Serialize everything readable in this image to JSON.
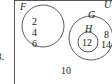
{
  "problem_number": "8.",
  "diagram": {
    "universal_label": "U",
    "sets": [
      {
        "label": "F",
        "elements": [
          "2",
          "4",
          "6"
        ]
      },
      {
        "label": "G",
        "elements": [
          "8",
          "14"
        ]
      },
      {
        "label": "H",
        "elements": [
          "12"
        ],
        "subset_of": "G"
      }
    ],
    "outside_elements": [
      "10"
    ]
  }
}
